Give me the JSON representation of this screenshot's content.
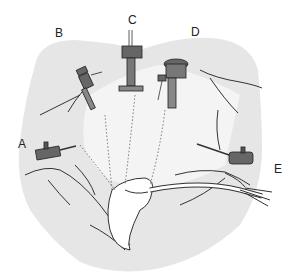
{
  "figure": {
    "colors": {
      "skin_shade": "#e6e6e6",
      "line": "#333333",
      "trocar": "#555555",
      "background": "#ffffff"
    },
    "labels": [
      {
        "id": "A",
        "text": "A",
        "x": 20,
        "y": 140
      },
      {
        "id": "B",
        "text": "B",
        "x": 55,
        "y": 28
      },
      {
        "id": "C",
        "text": "C",
        "x": 127,
        "y": 14
      },
      {
        "id": "D",
        "text": "D",
        "x": 192,
        "y": 26
      },
      {
        "id": "E",
        "text": "E",
        "x": 275,
        "y": 163
      }
    ]
  }
}
